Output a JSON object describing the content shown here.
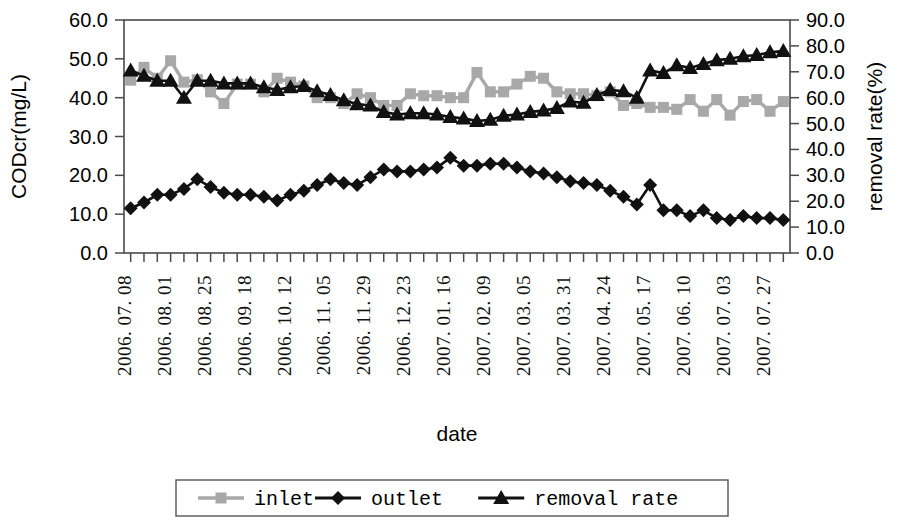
{
  "chart_data": {
    "type": "line",
    "title": "",
    "xlabel": "date",
    "ylabel": "CODcr(mg/L)",
    "y2label": "removal rate(%)",
    "ylim": [
      0,
      60
    ],
    "y2lim": [
      0,
      90
    ],
    "yticks": [
      "0.0",
      "10.0",
      "20.0",
      "30.0",
      "40.0",
      "50.0",
      "60.0"
    ],
    "y2ticks": [
      "0.0",
      "10.0",
      "20.0",
      "30.0",
      "40.0",
      "50.0",
      "60.0",
      "70.0",
      "80.0",
      "90.0"
    ],
    "grid": false,
    "legend_position": "bottom",
    "tick_labels": [
      "2006. 07. 08",
      "2006. 08. 01",
      "2006. 08. 25",
      "2006. 09. 18",
      "2006. 10. 12",
      "2006. 11. 05",
      "2006. 11. 29",
      "2006. 12. 23",
      "2007. 01. 16",
      "2007. 02. 09",
      "2007. 03. 05",
      "2007. 03. 31",
      "2007. 04. 24",
      "2007. 05. 17",
      "2007. 06. 10",
      "2007. 07. 03",
      "2007. 07. 27"
    ],
    "n_points": 50,
    "series": [
      {
        "name": "inlet",
        "axis": "left",
        "marker": "square",
        "color": "#a8a8a8",
        "values": [
          44.5,
          47.8,
          45.0,
          49.5,
          44.0,
          44.6,
          41.5,
          38.5,
          43.5,
          43.5,
          41.5,
          45.0,
          44.0,
          43.0,
          40.0,
          40.0,
          38.5,
          41.0,
          40.0,
          38.0,
          38.0,
          41.0,
          40.5,
          40.5,
          40.0,
          40.0,
          46.5,
          41.5,
          41.5,
          43.5,
          45.5,
          45.0,
          41.5,
          41.0,
          41.0,
          40.5,
          41.5,
          38.0,
          38.5,
          37.5,
          37.5,
          37.0,
          39.5,
          36.5,
          39.5,
          35.5,
          39.0,
          39.5,
          36.5,
          39.0
        ]
      },
      {
        "name": "outlet",
        "axis": "left",
        "marker": "diamond",
        "color": "#111111",
        "values": [
          11.5,
          13.0,
          15.0,
          15.0,
          16.5,
          19.0,
          17.0,
          15.5,
          15.0,
          15.0,
          14.5,
          13.5,
          15.0,
          16.0,
          17.5,
          19.0,
          18.0,
          17.5,
          19.5,
          21.5,
          21.0,
          21.0,
          21.5,
          22.0,
          24.5,
          22.5,
          22.5,
          23.0,
          23.0,
          22.0,
          21.0,
          20.5,
          19.5,
          18.5,
          18.0,
          17.5,
          16.0,
          14.5,
          12.5,
          17.5,
          11.0,
          11.0,
          9.5,
          11.0,
          9.0,
          8.5,
          9.5,
          9.0,
          9.0,
          8.5
        ]
      },
      {
        "name": "removal rate",
        "axis": "right",
        "marker": "triangle",
        "color": "#111111",
        "values": [
          70.5,
          68.5,
          66.5,
          66.5,
          60.0,
          66.5,
          66.5,
          65.5,
          65.5,
          65.5,
          64.0,
          63.0,
          64.0,
          64.5,
          62.5,
          61.0,
          59.0,
          57.5,
          57.0,
          54.5,
          53.5,
          54.0,
          54.0,
          53.5,
          52.5,
          52.0,
          51.0,
          51.5,
          53.0,
          53.5,
          54.5,
          55.0,
          56.0,
          58.5,
          58.0,
          61.0,
          63.0,
          62.5,
          60.0,
          70.5,
          69.5,
          72.5,
          71.5,
          73.0,
          74.5,
          75.0,
          76.0,
          76.5,
          77.5,
          78.0
        ]
      }
    ]
  },
  "legend": {
    "items": [
      {
        "label": "inlet",
        "marker": "square",
        "color": "#a8a8a8"
      },
      {
        "label": "outlet",
        "marker": "diamond",
        "color": "#111111"
      },
      {
        "label": "removal rate",
        "marker": "triangle",
        "color": "#111111"
      }
    ]
  }
}
